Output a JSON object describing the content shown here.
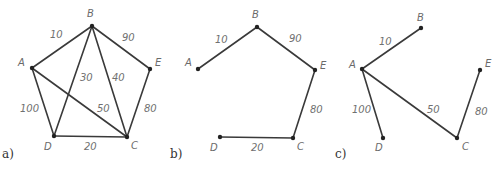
{
  "figure": {
    "panels": [
      {
        "id": "a",
        "label": "a)",
        "label_pos": [
          2,
          159
        ],
        "nodes": [
          {
            "name": "A",
            "x": 32,
            "y": 68,
            "lx": 18,
            "ly": 66
          },
          {
            "name": "B",
            "x": 92,
            "y": 26,
            "lx": 87,
            "ly": 17
          },
          {
            "name": "E",
            "x": 150,
            "y": 69,
            "lx": 155,
            "ly": 66
          },
          {
            "name": "D",
            "x": 54,
            "y": 136,
            "lx": 44,
            "ly": 150
          },
          {
            "name": "C",
            "x": 127,
            "y": 137,
            "lx": 131,
            "ly": 149
          }
        ],
        "edges": [
          {
            "from": "A",
            "to": "B",
            "weight": "10",
            "lx": 50,
            "ly": 38
          },
          {
            "from": "B",
            "to": "E",
            "weight": "90",
            "lx": 122,
            "ly": 41
          },
          {
            "from": "B",
            "to": "D",
            "weight": "30",
            "lx": 80,
            "ly": 81
          },
          {
            "from": "B",
            "to": "C",
            "weight": "40",
            "lx": 112,
            "ly": 81
          },
          {
            "from": "A",
            "to": "C",
            "weight": "50",
            "lx": 97,
            "ly": 112
          },
          {
            "from": "A",
            "to": "D",
            "weight": "100",
            "lx": 20,
            "ly": 112
          },
          {
            "from": "E",
            "to": "C",
            "weight": "80",
            "lx": 144,
            "ly": 112
          },
          {
            "from": "D",
            "to": "C",
            "weight": "20",
            "lx": 84,
            "ly": 150
          }
        ]
      },
      {
        "id": "b",
        "label": "b)",
        "label_pos": [
          170,
          159
        ],
        "nodes": [
          {
            "name": "A",
            "x": 198,
            "y": 69,
            "lx": 185,
            "ly": 66
          },
          {
            "name": "B",
            "x": 257,
            "y": 27,
            "lx": 252,
            "ly": 18
          },
          {
            "name": "E",
            "x": 315,
            "y": 70,
            "lx": 320,
            "ly": 69
          },
          {
            "name": "D",
            "x": 220,
            "y": 137,
            "lx": 210,
            "ly": 151
          },
          {
            "name": "C",
            "x": 293,
            "y": 138,
            "lx": 297,
            "ly": 150
          }
        ],
        "edges": [
          {
            "from": "A",
            "to": "B",
            "weight": "10",
            "lx": 215,
            "ly": 43
          },
          {
            "from": "B",
            "to": "E",
            "weight": "90",
            "lx": 289,
            "ly": 42
          },
          {
            "from": "E",
            "to": "C",
            "weight": "80",
            "lx": 310,
            "ly": 113
          },
          {
            "from": "D",
            "to": "C",
            "weight": "20",
            "lx": 251,
            "ly": 151
          }
        ]
      },
      {
        "id": "c",
        "label": "c)",
        "label_pos": [
          335,
          159
        ],
        "nodes": [
          {
            "name": "A",
            "x": 362,
            "y": 69,
            "lx": 349,
            "ly": 68
          },
          {
            "name": "B",
            "x": 421,
            "y": 28,
            "lx": 417,
            "ly": 21
          },
          {
            "name": "E",
            "x": 480,
            "y": 70,
            "lx": 485,
            "ly": 67
          },
          {
            "name": "D",
            "x": 383,
            "y": 138,
            "lx": 375,
            "ly": 151
          },
          {
            "name": "C",
            "x": 457,
            "y": 138,
            "lx": 462,
            "ly": 150
          }
        ],
        "edges": [
          {
            "from": "A",
            "to": "B",
            "weight": "10",
            "lx": 379,
            "ly": 45
          },
          {
            "from": "A",
            "to": "D",
            "weight": "100",
            "lx": 352,
            "ly": 113
          },
          {
            "from": "A",
            "to": "C",
            "weight": "50",
            "lx": 427,
            "ly": 113
          },
          {
            "from": "E",
            "to": "C",
            "weight": "80",
            "lx": 475,
            "ly": 115
          }
        ]
      }
    ]
  }
}
